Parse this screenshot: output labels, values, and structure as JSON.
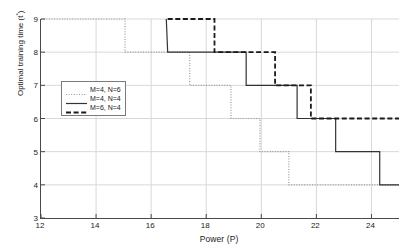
{
  "chart_data": {
    "type": "line",
    "title": "",
    "xlabel": "Power (P)",
    "ylabel": "Optimal training time (t*)",
    "ylabel_base": "Optimal training time (t",
    "ylabel_sup": "*",
    "ylabel_tail": ")",
    "xlim": [
      12,
      25
    ],
    "ylim": [
      3,
      9
    ],
    "xticks": [
      12,
      14,
      16,
      18,
      20,
      22,
      24
    ],
    "yticks": [
      3,
      4,
      5,
      6,
      7,
      8,
      9
    ],
    "grid": true,
    "legend_position": "center-left",
    "interpolation": "step-post",
    "series": [
      {
        "name": "M=4, N=6",
        "style": "dotted",
        "color": "#9a9a9a",
        "x": [
          12,
          15.05,
          15.05,
          17.4,
          17.4,
          18.9,
          18.9,
          19.95,
          19.95,
          21.0,
          21.0,
          25
        ],
        "y": [
          9,
          9,
          8,
          8,
          7,
          7,
          6,
          6,
          5,
          5,
          4,
          4
        ],
        "steps": [
          {
            "from_level": 9,
            "to_level": 8,
            "x": 15.05
          },
          {
            "from_level": 8,
            "to_level": 7,
            "x": 17.4
          },
          {
            "from_level": 7,
            "to_level": 6,
            "x": 18.9
          },
          {
            "from_level": 6,
            "to_level": 5,
            "x": 19.95
          },
          {
            "from_level": 5,
            "to_level": 4,
            "x": 21.0
          }
        ]
      },
      {
        "name": "M=4, N=4",
        "style": "solid",
        "color": "#333333",
        "x": [
          16.55,
          16.55,
          16.6,
          19.45,
          19.45,
          21.3,
          21.3,
          22.7,
          22.7,
          24.3,
          24.3,
          25
        ],
        "y": [
          9,
          9,
          8,
          8,
          7,
          7,
          6,
          6,
          5,
          5,
          4,
          4
        ],
        "steps": [
          {
            "from_level": 9,
            "to_level": 8,
            "x": 16.6
          },
          {
            "from_level": 8,
            "to_level": 7,
            "x": 19.45
          },
          {
            "from_level": 7,
            "to_level": 6,
            "x": 21.3
          },
          {
            "from_level": 6,
            "to_level": 5,
            "x": 22.7
          },
          {
            "from_level": 5,
            "to_level": 4,
            "x": 24.3
          }
        ]
      },
      {
        "name": "M=6, N=4",
        "style": "dashed",
        "color": "#1a1a1a",
        "x": [
          16.6,
          18.3,
          18.3,
          20.5,
          20.5,
          21.8,
          21.8,
          25
        ],
        "y": [
          9,
          9,
          8,
          8,
          7,
          7,
          6,
          6
        ],
        "steps": [
          {
            "from_level": 9,
            "to_level": 8,
            "x": 18.3
          },
          {
            "from_level": 8,
            "to_level": 7,
            "x": 20.5
          },
          {
            "from_level": 7,
            "to_level": 6,
            "x": 21.8
          }
        ]
      }
    ],
    "legend": [
      {
        "label": "M=4, N=6",
        "style": "dotted"
      },
      {
        "label": "M=4, N=4",
        "style": "solid"
      },
      {
        "label": "M=6, N=4",
        "style": "dashed"
      }
    ],
    "colors": {
      "background": "#ffffff",
      "axis": "#4a4a4a",
      "grid": "#d8d8d8",
      "dotted_series": "#9a9a9a",
      "solid_series": "#333333",
      "dashed_series": "#1a1a1a",
      "legend_border": "#7a7a7a",
      "text": "#1a1a1a"
    }
  }
}
